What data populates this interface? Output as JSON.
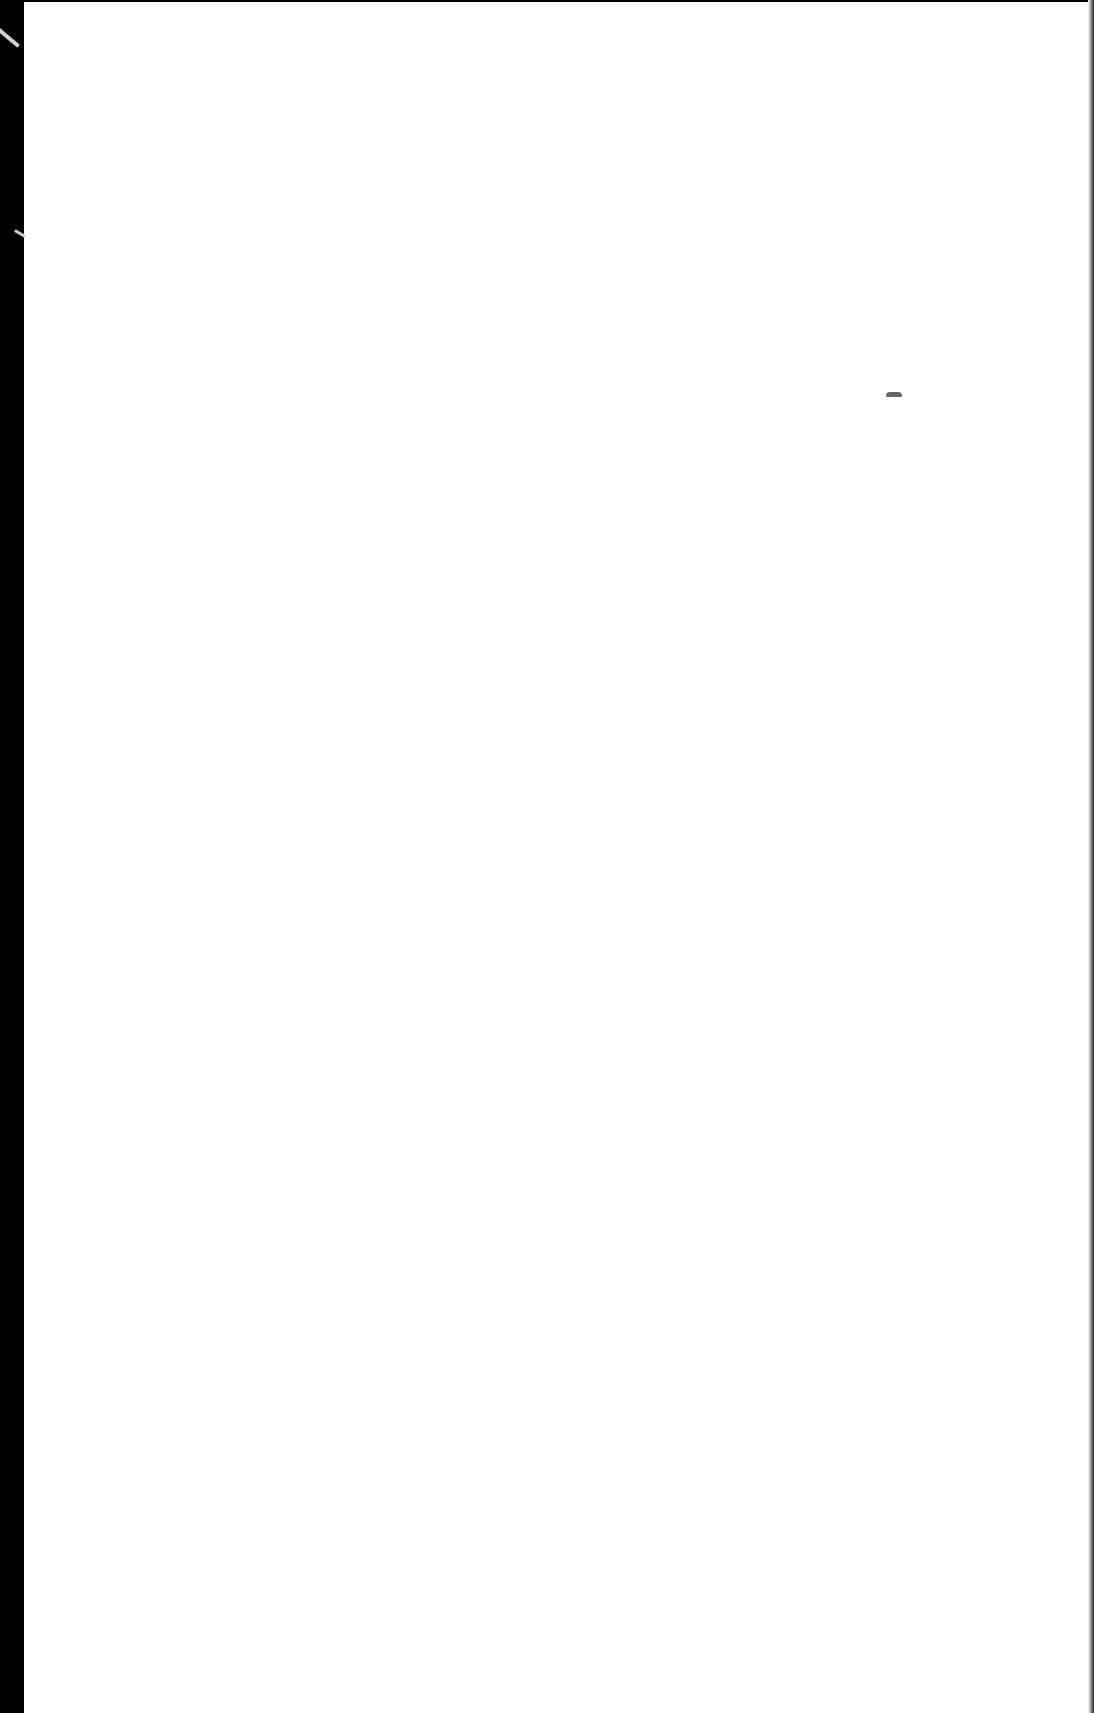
{
  "document": {
    "type": "scanned-page",
    "content": "",
    "colors": {
      "paper": "#ffffff",
      "background": "#000000",
      "smudge": "#666666"
    }
  }
}
